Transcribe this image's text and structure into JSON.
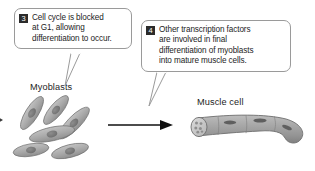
{
  "figure": {
    "background_color": "#ffffff",
    "callouts": [
      {
        "number": "3",
        "text": "Cell cycle is blocked\nat G1, allowing\ndifferentiation to occur.",
        "badge_color": "#2b2b2b",
        "border_color": "#9a9a9a"
      },
      {
        "number": "4",
        "text": "Other transcription factors\nare involved in final\ndifferentiation of myoblasts\ninto mature muscle cells.",
        "badge_color": "#2b2b2b",
        "border_color": "#9a9a9a"
      }
    ],
    "labels": {
      "myoblasts": "Myoblasts",
      "muscle_cell": "Muscle cell"
    },
    "artwork": {
      "myoblast_cell_fill": "#a9a9a9",
      "myoblast_nucleus_fill": "#7b7b7b",
      "muscle_cell_fill": "#a5a5a5",
      "muscle_cell_outline": "#6e6e6e",
      "arrow_color": "#101010"
    }
  }
}
